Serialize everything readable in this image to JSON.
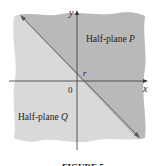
{
  "diagram": {
    "axis_x_label": "x",
    "axis_y_label": "y",
    "origin_label": "0",
    "line_label": "r",
    "region_p_label": "Half-plane ",
    "region_p_var": "P",
    "region_q_label": "Half-plane ",
    "region_q_var": "Q",
    "caption": "FIGURE 5",
    "colors": {
      "region_p": "#b9b9b9",
      "region_q": "#d9d9d9",
      "axis": "#333333",
      "line": "#555555"
    }
  }
}
